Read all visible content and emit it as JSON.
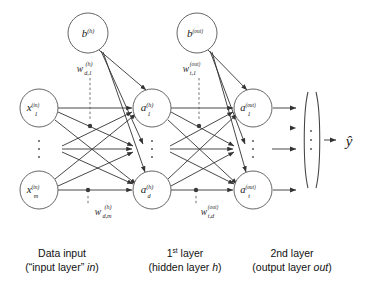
{
  "figure": {
    "colors": {
      "line": "#333333",
      "node_stroke": "#555555",
      "text": "#111111",
      "background": "#ffffff"
    }
  },
  "nodes": {
    "bias_hidden": {
      "base": "b",
      "sup": "(h)",
      "sub": "",
      "cx": 88,
      "cy": 33,
      "r": 20
    },
    "bias_output": {
      "base": "b",
      "sup": "(out)",
      "sub": "",
      "cx": 197,
      "cy": 33,
      "r": 20
    },
    "input_first": {
      "base": "x",
      "sup": "(in)",
      "sub": "1",
      "cx": 39,
      "cy": 108,
      "r": 19
    },
    "input_last": {
      "base": "x",
      "sup": "(in)",
      "sub": "m",
      "cx": 39,
      "cy": 190,
      "r": 19
    },
    "hidden_first": {
      "base": "a",
      "sup": "(h)",
      "sub": "1",
      "cx": 152,
      "cy": 108,
      "r": 19
    },
    "hidden_last": {
      "base": "a",
      "sup": "(h)",
      "sub": "d",
      "cx": 152,
      "cy": 190,
      "r": 19
    },
    "output_first": {
      "base": "a",
      "sup": "(out)",
      "sub": "1",
      "cx": 253,
      "cy": 108,
      "r": 19
    },
    "output_last": {
      "base": "a",
      "sup": "(out)",
      "sub": "t",
      "cx": 253,
      "cy": 190,
      "r": 19
    }
  },
  "weight_labels": {
    "hidden_d1": {
      "base": "w",
      "sub": "d,1",
      "sup": "(h)",
      "x": 80,
      "y": 72
    },
    "hidden_dm": {
      "base": "w",
      "sub": "d,m",
      "sup": "(h)",
      "x": 98,
      "y": 213
    },
    "output_t1": {
      "base": "w",
      "sub": "t,1",
      "sup": "(out)",
      "x": 186,
      "y": 72
    },
    "output_td": {
      "base": "w",
      "sub": "t,d",
      "sup": "(out)",
      "x": 204,
      "y": 213
    }
  },
  "prediction": {
    "symbol": "y",
    "accent": "hat",
    "x": 345,
    "y": 140
  },
  "ellipses": {
    "input_column": {
      "cx": 39,
      "cy": 149
    },
    "hidden_column": {
      "cx": 152,
      "cy": 149
    },
    "output_column": {
      "cx": 253,
      "cy": 149
    },
    "vector_column": {
      "cx": 311,
      "cy": 140
    }
  },
  "captions": [
    {
      "id": "input-layer-caption",
      "line1": "Data input",
      "line2_pre": "(“input layer” ",
      "line2_italic": "in",
      "line2_post": ")",
      "x": 62,
      "y": 256
    },
    {
      "id": "hidden-layer-caption",
      "line1_pre": "1",
      "line1_sup": "st",
      "line1_post": " layer",
      "line2_pre": "(hidden layer ",
      "line2_italic": "h",
      "line2_post": ")",
      "x": 185,
      "y": 256
    },
    {
      "id": "output-layer-caption",
      "line1": "2nd layer",
      "line2_pre": "(output layer ",
      "line2_italic": "out",
      "line2_post": ")",
      "x": 292,
      "y": 256
    }
  ]
}
